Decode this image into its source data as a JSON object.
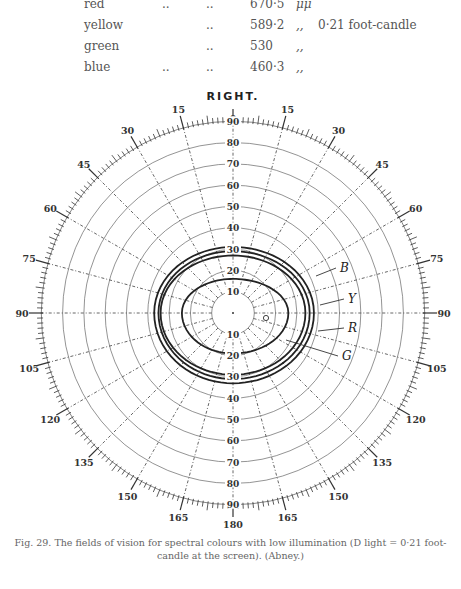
{
  "legend_table": [
    {
      "colour": "red",
      "dots1": "..",
      "dots2": "..",
      "wavelength": "670·5",
      "unit": "μμ",
      "illumination": ""
    },
    {
      "colour": "yellow",
      "dots1": "",
      "dots2": "..",
      "wavelength": "589·2",
      "unit": ",,",
      "illumination": "0·21 foot-candle"
    },
    {
      "colour": "green",
      "dots1": "",
      "dots2": "..",
      "wavelength": "530",
      "unit": ",,",
      "illumination": ""
    },
    {
      "colour": "blue",
      "dots1": "..",
      "dots2": "..",
      "wavelength": "460·3",
      "unit": ",,",
      "illumination": ""
    }
  ],
  "caption": {
    "line1": "Fig. 29.   The fields of vision for spectral colours with low illumination (D light = 0·21 foot-",
    "line2": "candle at the screen).   (Abney.)"
  },
  "chart_data": {
    "type": "polar",
    "title": "RIGHT.",
    "subtitle": "Perimeter chart — fields of vision for spectral colours",
    "angular_axis": {
      "tick_labels": [
        "0",
        "15",
        "30",
        "45",
        "60",
        "75",
        "90",
        "105",
        "120",
        "135",
        "150",
        "165",
        "180",
        "165",
        "150",
        "135",
        "120",
        "105",
        "90",
        "75",
        "60",
        "45",
        "30",
        "15"
      ],
      "major_step_deg": 15,
      "minor_ticks": true
    },
    "radial_axis": {
      "tick_labels": [
        "10",
        "20",
        "30",
        "40",
        "50",
        "60",
        "70",
        "80",
        "90"
      ],
      "range": [
        0,
        90
      ],
      "grid": true
    },
    "series": [
      {
        "name": "B",
        "colour": "blue",
        "wavelength": "460·3 μμ",
        "approx_extent_deg": {
          "up": 31,
          "right": 38,
          "down": 33,
          "left": 37
        }
      },
      {
        "name": "Y",
        "colour": "yellow",
        "wavelength": "589·2 μμ",
        "approx_extent_deg": {
          "up": 29,
          "right": 36,
          "down": 31,
          "left": 35
        }
      },
      {
        "name": "R",
        "colour": "red",
        "wavelength": "670·5 μμ",
        "approx_extent_deg": {
          "up": 27,
          "right": 34,
          "down": 29,
          "left": 34
        }
      },
      {
        "name": "G",
        "colour": "green",
        "wavelength": "530 μμ",
        "approx_extent_deg": {
          "up": 16,
          "right": 26,
          "down": 19,
          "left": 24
        }
      }
    ],
    "annotations": [
      "blind spot marker (small circle) at ~15° right"
    ]
  }
}
